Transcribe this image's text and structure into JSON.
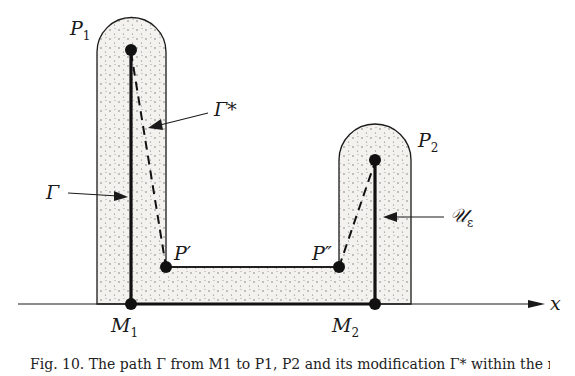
{
  "figure": {
    "labels": {
      "P1": {
        "main": "P",
        "sub": "1"
      },
      "P2": {
        "main": "P",
        "sub": "2"
      },
      "M1": {
        "main": "M",
        "sub": "1"
      },
      "M2": {
        "main": "M",
        "sub": "2"
      },
      "P_prime": "P′",
      "P_double_prime": "P″",
      "Gamma": "Γ",
      "Gamma_star": "Γ*",
      "U_eps": {
        "main": "𝒰",
        "sub": "ε"
      },
      "x_axis": "x"
    },
    "colors": {
      "stroke": "#1a1a1a",
      "fill_region": "#f3f1ee",
      "stipple": "#555555"
    },
    "caption": "Fig. 10. The path Γ from M1 to P1, P2 and its modification Γ* within the neighbourhood 𝒰ε"
  }
}
